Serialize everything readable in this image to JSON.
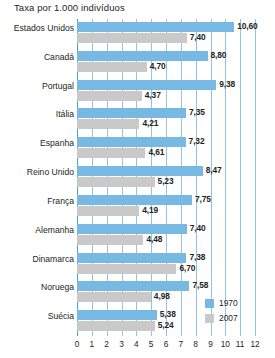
{
  "chart_data": {
    "type": "bar",
    "orientation": "horizontal",
    "title": "Taxa por 1.000 indivíduos",
    "xlabel": "",
    "ylabel": "",
    "xlim": [
      0,
      12
    ],
    "xticks": [
      0,
      1,
      2,
      3,
      4,
      5,
      6,
      7,
      8,
      9,
      10,
      11,
      12
    ],
    "xtick_labels": [
      "0",
      "1",
      "2",
      "3",
      "4",
      "5",
      "6",
      "7",
      "8",
      "9",
      "10",
      "11",
      "12"
    ],
    "grid": true,
    "legend_position": "bottom-right",
    "categories": [
      "Estados Unidos",
      "Canadá",
      "Portugal",
      "Itália",
      "Espanha",
      "Reino Unido",
      "França",
      "Alemanha",
      "Dinamarca",
      "Noruega",
      "Suécia"
    ],
    "series": [
      {
        "name": "1970",
        "color": "#78b9e3",
        "values": [
          10.6,
          8.8,
          9.38,
          7.35,
          7.32,
          8.47,
          7.75,
          7.4,
          7.38,
          7.58,
          5.38
        ],
        "value_labels": [
          "10,60",
          "8,80",
          "9,38",
          "7,35",
          "7,32",
          "8,47",
          "7,75",
          "7,40",
          "7,38",
          "7,58",
          "5,38"
        ]
      },
      {
        "name": "2007",
        "color": "#c9c9c9",
        "values": [
          7.4,
          4.7,
          4.37,
          4.21,
          4.61,
          5.23,
          4.19,
          4.48,
          6.7,
          4.98,
          5.24
        ],
        "value_labels": [
          "7,40",
          "4,70",
          "4,37",
          "4,21",
          "4,61",
          "5,23",
          "4,19",
          "4,48",
          "6,70",
          "4,98",
          "5,24"
        ]
      }
    ],
    "legend": [
      {
        "label": "1970",
        "color": "#78b9e3"
      },
      {
        "label": "2007",
        "color": "#c9c9c9"
      }
    ]
  }
}
